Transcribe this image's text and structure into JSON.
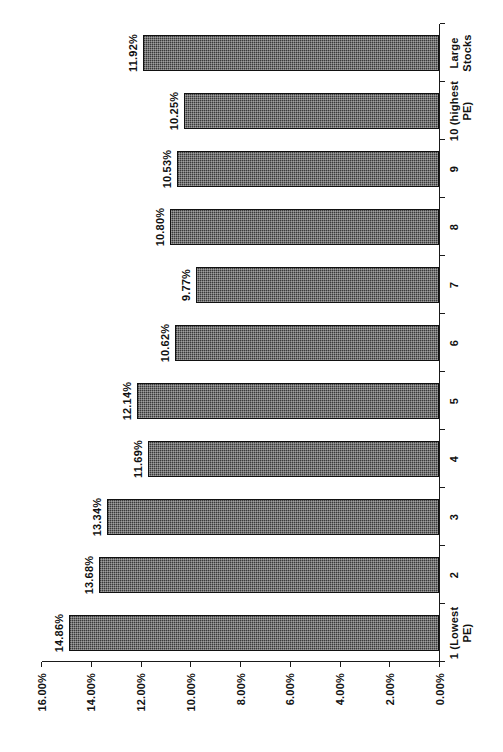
{
  "chart_data": {
    "type": "bar",
    "orientation": "horizontal-printed-rotated",
    "title": "",
    "xlabel": "",
    "ylabel": "",
    "ylim": [
      0,
      16
    ],
    "ytick_labels": [
      "0.00%",
      "2.00%",
      "4.00%",
      "6.00%",
      "8.00%",
      "10.00%",
      "12.00%",
      "14.00%",
      "16.00%"
    ],
    "ytick_values": [
      0,
      2,
      4,
      6,
      8,
      10,
      12,
      14,
      16
    ],
    "grid": false,
    "legend": null,
    "bar_color": "#3a3a3a",
    "bar_border_color": "#111111",
    "axis_color": "#1a1a1a",
    "categories": [
      "1 (Lowest PE)",
      "2",
      "3",
      "4",
      "5",
      "6",
      "7",
      "8",
      "9",
      "10 (highest PE)",
      "Large Stocks"
    ],
    "values": [
      14.86,
      13.68,
      13.34,
      11.69,
      12.14,
      10.62,
      9.77,
      10.8,
      10.53,
      10.25,
      11.92
    ],
    "data_labels": [
      "14.86%",
      "13.68%",
      "13.34%",
      "11.69%",
      "12.14%",
      "10.62%",
      "9.77%",
      "10.80%",
      "10.53%",
      "10.25%",
      "11.92%"
    ]
  }
}
